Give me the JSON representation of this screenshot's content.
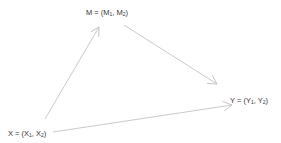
{
  "diagram": {
    "nodes": [
      {
        "id": "M",
        "name": "M",
        "components": [
          "M",
          "M"
        ],
        "subs": [
          "1",
          "2"
        ],
        "x": 86,
        "y": 9
      },
      {
        "id": "Y",
        "name": "Y",
        "components": [
          "Y",
          "Y"
        ],
        "subs": [
          "1",
          "2"
        ],
        "x": 230,
        "y": 97
      },
      {
        "id": "X",
        "name": "X",
        "components": [
          "X",
          "X"
        ],
        "subs": [
          "1",
          "2"
        ],
        "x": 8,
        "y": 130
      }
    ],
    "edges": [
      {
        "from": "X",
        "to": "M",
        "x1": 45,
        "y1": 119,
        "x2": 99,
        "y2": 27
      },
      {
        "from": "M",
        "to": "Y",
        "x1": 124,
        "y1": 25,
        "x2": 217,
        "y2": 84
      },
      {
        "from": "X",
        "to": "Y",
        "x1": 53,
        "y1": 132,
        "x2": 232,
        "y2": 105
      }
    ],
    "colors": {
      "edge": "#bdbdbd",
      "text": "#333333",
      "background": "#ffffff"
    }
  }
}
